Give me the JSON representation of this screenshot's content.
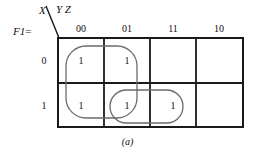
{
  "figure": {
    "caption": "(a)",
    "function_label": "F1",
    "equals_sign": "=",
    "row_variable": "X",
    "column_variables": "Y Z",
    "colors": {
      "grid_line": "#1a1a1a",
      "loop_line": "#6b6b6b",
      "text": "#111111",
      "background": "#ffffff"
    }
  },
  "kmap": {
    "column_headers": [
      "00",
      "01",
      "11",
      "10"
    ],
    "row_headers": [
      "0",
      "1"
    ],
    "cells": [
      [
        "1",
        "1",
        "",
        ""
      ],
      [
        "1",
        "1",
        "1",
        ""
      ]
    ],
    "groups": [
      {
        "name": "group-rounded-rect-left",
        "shape": "rounded-rectangle",
        "cells": "rows 0-1, columns 00-01"
      },
      {
        "name": "group-pill-bottom",
        "shape": "pill",
        "cells": "row 1, columns 01-11"
      }
    ]
  }
}
